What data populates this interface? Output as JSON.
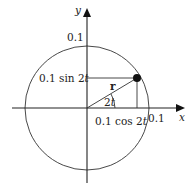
{
  "diagram": {
    "type": "unit-circle-vector",
    "colors": {
      "line": "#333333",
      "dot": "#111111",
      "background": "#ffffff"
    },
    "axes": {
      "x_label": "x",
      "y_label": "y"
    },
    "circle": {
      "radius_label_x": "0.1",
      "radius_label_y": "0.1"
    },
    "vector": {
      "label": "r",
      "angle_label_num": "2",
      "angle_label_var": "t"
    },
    "projections": {
      "horizontal_label_prefix": "0.1 sin 2",
      "horizontal_label_var": "t",
      "vertical_label_prefix": "0.1 cos 2",
      "vertical_label_var": "t"
    }
  }
}
